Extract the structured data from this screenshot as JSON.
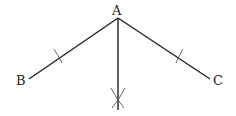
{
  "diagram": {
    "type": "geometric-construction",
    "stroke_color": "#222222",
    "arc_color": "#555555",
    "points": {
      "A": {
        "label": "A",
        "x": 118,
        "y": 18
      },
      "B": {
        "label": "B",
        "x": 29,
        "y": 79
      },
      "C": {
        "label": "C",
        "x": 210,
        "y": 79
      },
      "bisector_end": {
        "x": 118,
        "y": 110
      },
      "arc_intersection": {
        "x": 118,
        "y": 98
      }
    },
    "segments": [
      {
        "from": "A",
        "to": "B"
      },
      {
        "from": "A",
        "to": "C"
      },
      {
        "from": "A",
        "to": "bisector_end"
      }
    ],
    "tick_marks": [
      {
        "on": "AB",
        "x": 59,
        "y": 58
      },
      {
        "on": "AC",
        "x": 179,
        "y": 58
      }
    ]
  },
  "labels": {
    "A": "A",
    "B": "B",
    "C": "C"
  }
}
